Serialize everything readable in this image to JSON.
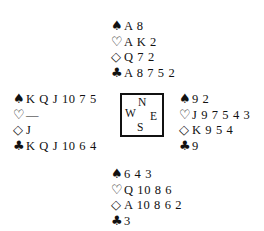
{
  "suit_symbols": {
    "spades": "♠",
    "hearts": "♡",
    "diamonds": "◇",
    "clubs": "♣"
  },
  "hands": {
    "north": {
      "spades": "A 8",
      "hearts": "A K 2",
      "diamonds": "Q 7 2",
      "clubs": "A 8 7 5 2"
    },
    "west": {
      "spades": "K Q J 10 7 5",
      "hearts": "—",
      "diamonds": "J",
      "clubs": "K Q J 10 6 4"
    },
    "east": {
      "spades": "9 2",
      "hearts": "J 9 7 5 4 3",
      "diamonds": "K 9 5 4",
      "clubs": "9"
    },
    "south": {
      "spades": "6 4 3",
      "hearts": "Q 10 8 6",
      "diamonds": "A 10 8 6 2",
      "clubs": "3"
    }
  },
  "compass": {
    "north": "N",
    "west": "W",
    "east": "E",
    "south": "S"
  }
}
